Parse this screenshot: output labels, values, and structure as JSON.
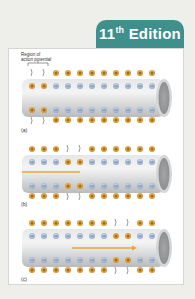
{
  "badge": {
    "number": "11",
    "suffix": "th",
    "word": "Edition"
  },
  "figure": {
    "region_label_line1": "Region of",
    "region_label_line2": "action potential",
    "direction_label": "Direction of nerve impulse",
    "colors": {
      "positive": "#e6a23a",
      "negative": "#a9bcd8",
      "arrow": "#e3a93b",
      "tube": "#c9cbcd"
    },
    "columns": 11,
    "panels": [
      {
        "label": "(a)",
        "depolarized_columns": [
          0,
          1
        ],
        "outer_gap_columns": [
          0,
          1
        ],
        "has_region_bracket": true
      },
      {
        "label": "(b)",
        "depolarized_columns": [
          3,
          4
        ],
        "outer_gap_columns": [
          3,
          4
        ],
        "has_direction_label": true
      },
      {
        "label": "(c)",
        "depolarized_columns": [
          7,
          8
        ],
        "outer_gap_columns": [
          7,
          8
        ],
        "has_direction_arrow": true
      }
    ]
  }
}
